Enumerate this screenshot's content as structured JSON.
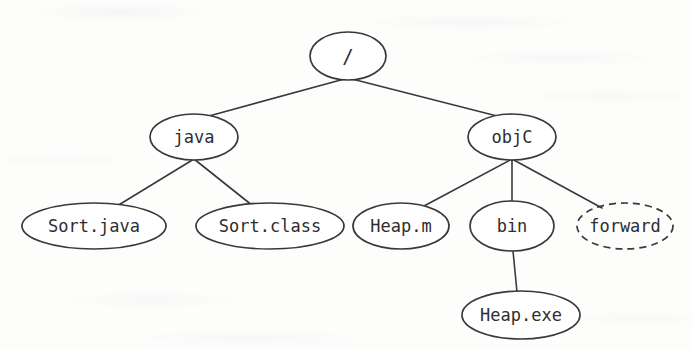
{
  "diagram": {
    "type": "tree",
    "stroke_color": "#39393b",
    "text_color": "#2e2e30",
    "background_color": "#fdfdfc",
    "nodes": [
      {
        "id": "root",
        "label": "/",
        "cx": 348,
        "cy": 56,
        "rx": 38,
        "ry": 24,
        "style": "solid",
        "font_size": 19
      },
      {
        "id": "java",
        "label": "java",
        "cx": 194,
        "cy": 137,
        "rx": 44,
        "ry": 23,
        "style": "solid",
        "font_size": 17
      },
      {
        "id": "objc",
        "label": "objC",
        "cx": 512,
        "cy": 137,
        "rx": 44,
        "ry": 23,
        "style": "solid",
        "font_size": 17
      },
      {
        "id": "sortjava",
        "label": "Sort.java",
        "cx": 94,
        "cy": 226,
        "rx": 72,
        "ry": 23,
        "style": "solid",
        "font_size": 17
      },
      {
        "id": "sortclass",
        "label": "Sort.class",
        "cx": 270,
        "cy": 226,
        "rx": 74,
        "ry": 23,
        "style": "solid",
        "font_size": 17
      },
      {
        "id": "heapm",
        "label": "Heap.m",
        "cx": 401,
        "cy": 226,
        "rx": 48,
        "ry": 23,
        "style": "solid",
        "font_size": 17
      },
      {
        "id": "bin",
        "label": "bin",
        "cx": 512,
        "cy": 226,
        "rx": 42,
        "ry": 25,
        "style": "solid",
        "font_size": 17
      },
      {
        "id": "forward",
        "label": "forward",
        "cx": 625,
        "cy": 226,
        "rx": 48,
        "ry": 23,
        "style": "dashed",
        "font_size": 17
      },
      {
        "id": "heapexe",
        "label": "Heap.exe",
        "cx": 521,
        "cy": 315,
        "rx": 59,
        "ry": 24,
        "style": "solid",
        "font_size": 17
      }
    ],
    "edges": [
      {
        "from": "root",
        "to": "java",
        "x1": 348,
        "y1": 78,
        "x2": 209,
        "y2": 116
      },
      {
        "from": "root",
        "to": "objc",
        "x1": 348,
        "y1": 78,
        "x2": 497,
        "y2": 116
      },
      {
        "from": "java",
        "to": "sortjava",
        "x1": 194,
        "y1": 159,
        "x2": 117,
        "y2": 206
      },
      {
        "from": "java",
        "to": "sortclass",
        "x1": 194,
        "y1": 159,
        "x2": 253,
        "y2": 206
      },
      {
        "from": "objc",
        "to": "heapm",
        "x1": 512,
        "y1": 159,
        "x2": 424,
        "y2": 206
      },
      {
        "from": "objc",
        "to": "bin",
        "x1": 512,
        "y1": 159,
        "x2": 512,
        "y2": 202
      },
      {
        "from": "objc",
        "to": "forward",
        "x1": 512,
        "y1": 159,
        "x2": 602,
        "y2": 208
      },
      {
        "from": "bin",
        "to": "heapexe",
        "x1": 513,
        "y1": 251,
        "x2": 517,
        "y2": 292
      }
    ]
  }
}
